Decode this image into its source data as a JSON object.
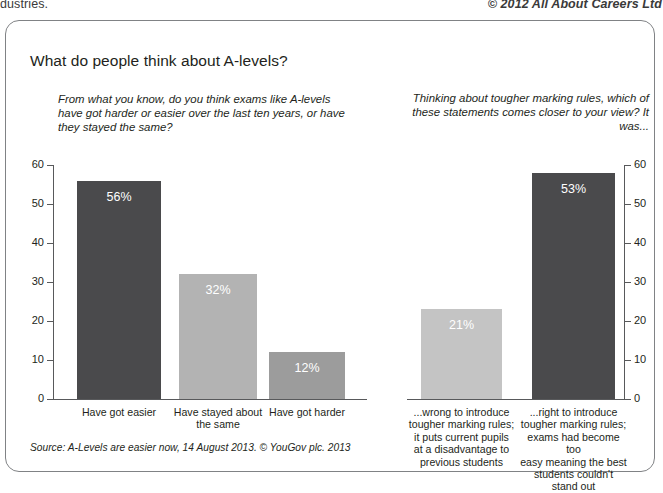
{
  "page_header": {
    "left_text": "dustries.",
    "right_text": "© 2012 All About Careers Ltd"
  },
  "card": {
    "title": "What do people think about A-levels?",
    "source_note": "Source: A-Levels are easier now, 14 August 2013. © YouGov plc. 2013"
  },
  "panels": {
    "left": {
      "subtitle": "From what you know, do you think exams like A-levels have got harder or easier over the last ten years, or have they stayed the same?"
    },
    "right": {
      "subtitle": "Thinking about tougher marking rules, which of these statements comes closer to your view? It was..."
    }
  },
  "colors": {
    "bar_dark": "#4a4a4c",
    "bar_light": "#b3b3b3",
    "bar_medium": "#9c9c9c",
    "axis": "#58595b",
    "card_border": "#808285",
    "text": "#231f20",
    "value_label": "#ffffff"
  },
  "chart_data": [
    {
      "type": "bar",
      "title": "From what you know, do you think exams like A-levels have got harder or easier over the last ten years, or have they stayed the same?",
      "xlabel": "",
      "ylabel": "",
      "ylim": [
        0,
        60
      ],
      "yticks": [
        0,
        10,
        20,
        30,
        40,
        50,
        60
      ],
      "ytick_labels": [
        "0",
        "10",
        "20",
        "30",
        "40",
        "50",
        "60"
      ],
      "grid": false,
      "legend": "none",
      "axis_position": "left",
      "categories": [
        "Have got easier",
        "Have stayed about the same",
        "Have got harder"
      ],
      "values": [
        56,
        32,
        12
      ],
      "data_labels": [
        "56%",
        "32%",
        "12%"
      ],
      "bar_colors": [
        "#4a4a4c",
        "#b3b3b3",
        "#9c9c9c"
      ]
    },
    {
      "type": "bar",
      "title": "Thinking about tougher marking rules, which of these statements comes closer to your view? It was...",
      "xlabel": "",
      "ylabel": "",
      "ylim": [
        0,
        60
      ],
      "yticks": [
        0,
        10,
        20,
        30,
        40,
        50,
        60
      ],
      "ytick_labels": [
        "0",
        "10",
        "20",
        "30",
        "40",
        "50",
        "60"
      ],
      "grid": false,
      "legend": "none",
      "axis_position": "right",
      "categories": [
        "...wrong to introduce tougher marking rules; it puts current pupils at a disadvantage to previous students",
        "...right to introduce tougher marking rules; exams had become too easy meaning the best students couldn't stand out"
      ],
      "values": [
        21,
        53
      ],
      "plotted_heights": [
        23,
        58
      ],
      "data_labels": [
        "21%",
        "53%"
      ],
      "bar_colors": [
        "#c4c4c4",
        "#4a4a4c"
      ]
    }
  ],
  "left_chart": {
    "y_ticks": [
      {
        "label": "60",
        "value": 60
      },
      {
        "label": "50",
        "value": 50
      },
      {
        "label": "40",
        "value": 40
      },
      {
        "label": "30",
        "value": 30
      },
      {
        "label": "20",
        "value": 20
      },
      {
        "label": "10",
        "value": 10
      },
      {
        "label": "0",
        "value": 0
      }
    ],
    "bars": [
      {
        "label": "56%",
        "category_lines": [
          "Have got easier"
        ]
      },
      {
        "label": "32%",
        "category_lines": [
          "Have stayed about",
          "the same"
        ]
      },
      {
        "label": "12%",
        "category_lines": [
          "Have got harder"
        ]
      }
    ]
  },
  "right_chart": {
    "y_ticks": [
      {
        "label": "60",
        "value": 60
      },
      {
        "label": "50",
        "value": 50
      },
      {
        "label": "40",
        "value": 40
      },
      {
        "label": "30",
        "value": 30
      },
      {
        "label": "20",
        "value": 20
      },
      {
        "label": "10",
        "value": 10
      },
      {
        "label": "0",
        "value": 0
      }
    ],
    "bars": [
      {
        "label": "21%",
        "category_lines": [
          "...wrong to introduce",
          "tougher marking rules;",
          "it puts current pupils",
          "at a disadvantage to",
          "previous students"
        ]
      },
      {
        "label": "53%",
        "category_lines": [
          "...right to introduce",
          "tougher marking rules;",
          "exams had become too",
          "easy meaning the best",
          "students couldn't",
          "stand out"
        ]
      }
    ]
  }
}
